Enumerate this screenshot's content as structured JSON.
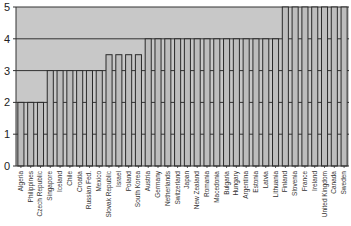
{
  "chart_data": {
    "type": "bar",
    "title": "",
    "xlabel": "",
    "ylabel": "",
    "ylim": [
      0,
      5
    ],
    "yticks": [
      0,
      1,
      2,
      3,
      4,
      5
    ],
    "grid": true,
    "legend": null,
    "categories": [
      "Algeria",
      "Philippines",
      "Czech Republic",
      "Singapore",
      "Iceland",
      "Chile",
      "Croatia",
      "Russian Fed.",
      "Mexico",
      "Slovak Republic",
      "Israel",
      "Poland",
      "South Korea",
      "Austria",
      "Germany",
      "Netherlands",
      "Switzerland",
      "Japan",
      "New Zealand",
      "Romania",
      "Macedonia",
      "Bulgaria",
      "Hungary",
      "Argentina",
      "Estonia",
      "Latvia",
      "Lithuania",
      "Finland",
      "Slovenia",
      "France",
      "Ireland",
      "United Kingdom",
      "Canada",
      "Sweden"
    ],
    "values": [
      2,
      2,
      2,
      3,
      3,
      3,
      3,
      3,
      3,
      3.5,
      3.5,
      3.5,
      3.5,
      4,
      4,
      4,
      4,
      4,
      4,
      4,
      4,
      4,
      4,
      4,
      4,
      4,
      4,
      5,
      5,
      5,
      5,
      5,
      5,
      5
    ]
  },
  "colors": {
    "plot_bg": "#c8c8c8",
    "bar_fill": "#bdbdbd",
    "bar_edge": "#2a2a2a",
    "grid": "#333333"
  }
}
